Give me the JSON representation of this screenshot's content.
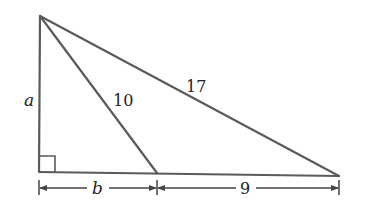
{
  "diagram": {
    "type": "right-triangle-with-cevian",
    "colors": {
      "edge": "#5a5a5a",
      "dimension": "#444444",
      "text": "#222222"
    },
    "points": {
      "top": [
        40,
        16
      ],
      "right_angle": [
        39,
        172
      ],
      "mid_base": [
        157,
        173
      ],
      "base_right": [
        339,
        176
      ]
    },
    "labels": {
      "left_side": "a",
      "cevian": "10",
      "hypotenuse": "17",
      "base_left_segment": "b",
      "base_right_segment": "9"
    },
    "right_angle_marker": true
  }
}
